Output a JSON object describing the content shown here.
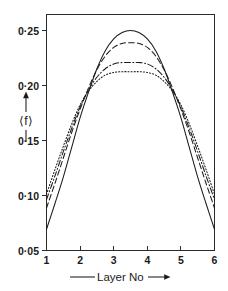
{
  "figure": {
    "name": "layer-number-mean-f-plot",
    "background_color": "#ffffff",
    "ink_color": "#1a1a1a"
  },
  "axes": {
    "y_title": "⟨f⟩",
    "y_title_plain": "<f>",
    "x_title": "Layer No",
    "x_title_prefix_rule": true,
    "x_title_suffix_arrow": true,
    "y_arrow_up": true,
    "y_arrow_down": true
  },
  "chart_data": {
    "type": "line",
    "title": "",
    "xlabel": "Layer No",
    "ylabel": "⟨f⟩",
    "xlim": [
      1,
      6
    ],
    "ylim": [
      0.05,
      0.272
    ],
    "grid": false,
    "legend_position": "none",
    "xticks": [
      1,
      2,
      3,
      4,
      5,
      6
    ],
    "xticklabels": [
      "1",
      "2",
      "3",
      "4",
      "5",
      "6"
    ],
    "yticks": [
      0.05,
      0.1,
      0.15,
      0.2,
      0.25
    ],
    "yticklabels": [
      "0·05",
      "0·10",
      "0·15",
      "0·20",
      "0·25"
    ],
    "x": [
      1.0,
      1.25,
      1.5,
      1.75,
      2.0,
      2.25,
      2.5,
      2.75,
      3.0,
      3.25,
      3.5,
      3.75,
      4.0,
      4.25,
      4.5,
      4.75,
      5.0,
      5.25,
      5.5,
      5.75,
      6.0
    ],
    "series": [
      {
        "name": "curve-1",
        "linestyle": "solid",
        "peak_value": 0.257,
        "peak_x": 3.5,
        "values": [
          0.07,
          0.094,
          0.119,
          0.147,
          0.175,
          0.199,
          0.221,
          0.238,
          0.249,
          0.255,
          0.257,
          0.255,
          0.249,
          0.238,
          0.221,
          0.199,
          0.175,
          0.147,
          0.119,
          0.094,
          0.07
        ]
      },
      {
        "name": "curve-2",
        "linestyle": "dashed",
        "peak_value": 0.2455,
        "peak_x": 3.5,
        "values": [
          0.09,
          0.113,
          0.137,
          0.161,
          0.183,
          0.203,
          0.22,
          0.233,
          0.241,
          0.2448,
          0.2455,
          0.2448,
          0.241,
          0.233,
          0.22,
          0.203,
          0.183,
          0.161,
          0.137,
          0.113,
          0.09
        ]
      },
      {
        "name": "curve-3",
        "linestyle": "dashdot",
        "peak_value": 0.2268,
        "peak_x": 3.5,
        "values": [
          0.098,
          0.12,
          0.143,
          0.165,
          0.185,
          0.201,
          0.213,
          0.221,
          0.2255,
          0.2268,
          0.2268,
          0.2268,
          0.2255,
          0.221,
          0.213,
          0.201,
          0.185,
          0.165,
          0.143,
          0.12,
          0.098
        ]
      },
      {
        "name": "curve-4",
        "linestyle": "dotted",
        "peak_value": 0.2182,
        "peak_x": 3.5,
        "values": [
          0.103,
          0.126,
          0.148,
          0.169,
          0.187,
          0.2,
          0.209,
          0.215,
          0.2175,
          0.2182,
          0.2182,
          0.2182,
          0.2175,
          0.215,
          0.209,
          0.2,
          0.187,
          0.169,
          0.148,
          0.126,
          0.103
        ]
      }
    ]
  }
}
